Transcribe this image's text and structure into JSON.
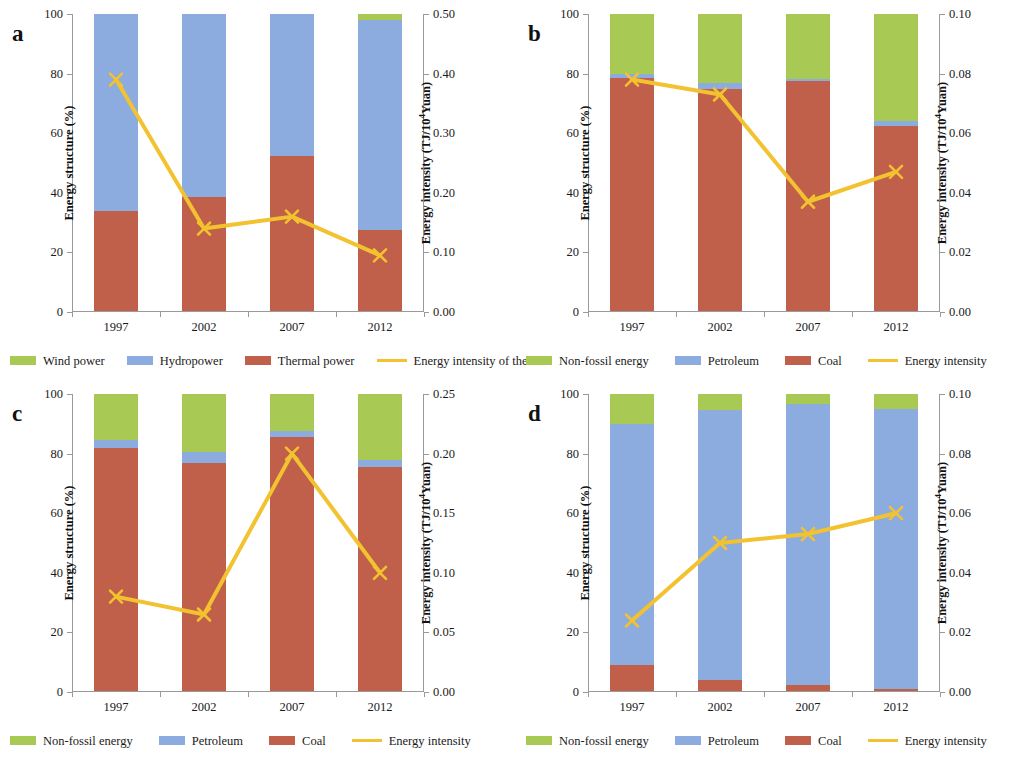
{
  "figure": {
    "panels": [
      "a",
      "b",
      "c",
      "d"
    ]
  },
  "common": {
    "y_left_title": "Energy structure (%)",
    "y_right_title_prefix": "Energy intensity (TJ/10",
    "y_right_title_exp": "4",
    "y_right_title_suffix": "Yuan)",
    "categories": [
      "1997",
      "2002",
      "2007",
      "2012"
    ],
    "colors": {
      "green": "#a8c954",
      "blue": "#8cabdf",
      "red": "#c0604a",
      "yellow": "#f2c230",
      "axis": "#9a9a9a"
    }
  },
  "chart_data": [
    {
      "panel": "a",
      "type": "bar",
      "title": "",
      "xlabel": "",
      "ylabel": "Energy structure (%)",
      "y2label": "Energy intensity (TJ/10⁴Yuan)",
      "categories": [
        "1997",
        "2002",
        "2007",
        "2012"
      ],
      "ylim": [
        0,
        100
      ],
      "yticks": [
        0,
        20,
        40,
        60,
        80,
        100
      ],
      "ytick_labels": [
        "0",
        "20",
        "40",
        "60",
        "80",
        "100"
      ],
      "y2lim": [
        0.0,
        0.5
      ],
      "y2ticks": [
        0.0,
        0.1,
        0.2,
        0.3,
        0.4,
        0.5
      ],
      "y2tick_labels": [
        "0.00",
        "0.10",
        "0.20",
        "0.30",
        "0.40",
        "0.50"
      ],
      "grid": false,
      "legend_position": "bottom",
      "series": [
        {
          "name": "Thermal power",
          "color": "#c0604a",
          "kind": "bar",
          "values": [
            34.0,
            38.5,
            52.5,
            27.5
          ]
        },
        {
          "name": "Hydropower",
          "color": "#8cabdf",
          "kind": "bar",
          "values": [
            66.0,
            61.5,
            47.5,
            70.5
          ]
        },
        {
          "name": "Wind power",
          "color": "#a8c954",
          "kind": "bar",
          "values": [
            0.0,
            0.0,
            0.0,
            2.0
          ]
        },
        {
          "name": "Energy intensity of thermal",
          "color": "#f2c230",
          "kind": "line",
          "axis": "right",
          "values": [
            0.39,
            0.14,
            0.16,
            0.095
          ]
        }
      ],
      "legend": [
        "Wind power",
        "Hydropower",
        "Thermal power",
        "Energy intensity of thermal"
      ]
    },
    {
      "panel": "b",
      "type": "bar",
      "title": "",
      "xlabel": "",
      "ylabel": "Energy structure (%)",
      "y2label": "Energy intensity (TJ/10⁴Yuan)",
      "categories": [
        "1997",
        "2002",
        "2007",
        "2012"
      ],
      "ylim": [
        0,
        100
      ],
      "yticks": [
        0,
        20,
        40,
        60,
        80,
        100
      ],
      "ytick_labels": [
        "0",
        "20",
        "40",
        "60",
        "80",
        "100"
      ],
      "y2lim": [
        0.0,
        0.1
      ],
      "y2ticks": [
        0.0,
        0.02,
        0.04,
        0.06,
        0.08,
        0.1
      ],
      "y2tick_labels": [
        "0.00",
        "0.02",
        "0.04",
        "0.06",
        "0.08",
        "0.10"
      ],
      "grid": false,
      "legend_position": "bottom",
      "series": [
        {
          "name": "Coal",
          "color": "#c0604a",
          "kind": "bar",
          "values": [
            78.5,
            75.0,
            77.5,
            62.5
          ]
        },
        {
          "name": "Petroleum",
          "color": "#8cabdf",
          "kind": "bar",
          "values": [
            1.5,
            1.8,
            0.8,
            1.5
          ]
        },
        {
          "name": "Non-fossil energy",
          "color": "#a8c954",
          "kind": "bar",
          "values": [
            20.0,
            23.2,
            21.7,
            36.0
          ]
        },
        {
          "name": "Energy intensity",
          "color": "#f2c230",
          "kind": "line",
          "axis": "right",
          "values": [
            0.078,
            0.073,
            0.037,
            0.047
          ]
        }
      ],
      "legend": [
        "Non-fossil energy",
        "Petroleum",
        "Coal",
        "Energy intensity"
      ]
    },
    {
      "panel": "c",
      "type": "bar",
      "title": "",
      "xlabel": "",
      "ylabel": "Energy structure (%)",
      "y2label": "Energy intensity (TJ/10⁴Yuan)",
      "categories": [
        "1997",
        "2002",
        "2007",
        "2012"
      ],
      "ylim": [
        0,
        100
      ],
      "yticks": [
        0,
        20,
        40,
        60,
        80,
        100
      ],
      "ytick_labels": [
        "0",
        "20",
        "40",
        "60",
        "80",
        "100"
      ],
      "y2lim": [
        0.0,
        0.25
      ],
      "y2ticks": [
        0.0,
        0.05,
        0.1,
        0.15,
        0.2,
        0.25
      ],
      "y2tick_labels": [
        "0.00",
        "0.05",
        "0.10",
        "0.15",
        "0.20",
        "0.25"
      ],
      "grid": false,
      "legend_position": "bottom",
      "series": [
        {
          "name": "Coal",
          "color": "#c0604a",
          "kind": "bar",
          "values": [
            82.0,
            77.0,
            85.5,
            75.5
          ]
        },
        {
          "name": "Petroleum",
          "color": "#8cabdf",
          "kind": "bar",
          "values": [
            2.5,
            3.5,
            2.0,
            2.5
          ]
        },
        {
          "name": "Non-fossil energy",
          "color": "#a8c954",
          "kind": "bar",
          "values": [
            15.5,
            19.5,
            12.5,
            22.0
          ]
        },
        {
          "name": "Energy intensity",
          "color": "#f2c230",
          "kind": "line",
          "axis": "right",
          "values": [
            0.08,
            0.065,
            0.2,
            0.1
          ]
        }
      ],
      "legend": [
        "Non-fossil energy",
        "Petroleum",
        "Coal",
        "Energy intensity"
      ]
    },
    {
      "panel": "d",
      "type": "bar",
      "title": "",
      "xlabel": "",
      "ylabel": "Energy structure (%)",
      "y2label": "Energy intensity (TJ/10⁴Yuan)",
      "categories": [
        "1997",
        "2002",
        "2007",
        "2012"
      ],
      "ylim": [
        0,
        100
      ],
      "yticks": [
        0,
        20,
        40,
        60,
        80,
        100
      ],
      "ytick_labels": [
        "0",
        "20",
        "40",
        "60",
        "80",
        "100"
      ],
      "y2lim": [
        0.0,
        0.1
      ],
      "y2ticks": [
        0.0,
        0.02,
        0.04,
        0.06,
        0.08,
        0.1
      ],
      "y2tick_labels": [
        "0.00",
        "0.02",
        "0.04",
        "0.06",
        "0.08",
        "0.10"
      ],
      "grid": false,
      "legend_position": "bottom",
      "series": [
        {
          "name": "Coal",
          "color": "#c0604a",
          "kind": "bar",
          "values": [
            9.0,
            4.0,
            2.5,
            1.0
          ]
        },
        {
          "name": "Petroleum",
          "color": "#8cabdf",
          "kind": "bar",
          "values": [
            81.0,
            90.5,
            94.0,
            94.0
          ]
        },
        {
          "name": "Non-fossil energy",
          "color": "#a8c954",
          "kind": "bar",
          "values": [
            10.0,
            5.5,
            3.5,
            5.0
          ]
        },
        {
          "name": "Energy intensity",
          "color": "#f2c230",
          "kind": "line",
          "axis": "right",
          "values": [
            0.024,
            0.05,
            0.053,
            0.06
          ]
        }
      ],
      "legend": [
        "Non-fossil energy",
        "Petroleum",
        "Coal",
        "Energy intensity"
      ]
    }
  ]
}
